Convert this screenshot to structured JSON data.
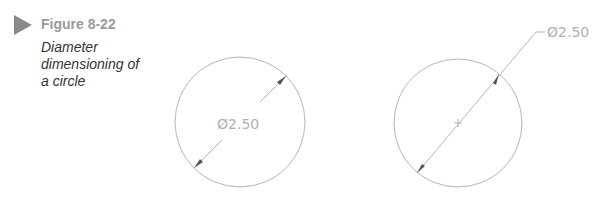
{
  "figure": {
    "number": "Figure 8-22",
    "caption_lines": [
      "Diameter",
      "dimensioning of",
      "a circle"
    ],
    "icon": "triangle-play-icon"
  },
  "drawing": {
    "left_circle": {
      "dimension_text": "Ø2.50",
      "style": "inside"
    },
    "right_circle": {
      "dimension_text": "Ø2.50",
      "style": "leader",
      "center_mark": true
    },
    "colors": {
      "line": "#b5b5b5",
      "text": "#b0b0b0",
      "arrow": "#555555"
    }
  }
}
